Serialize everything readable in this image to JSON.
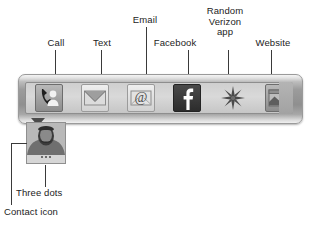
{
  "figure": {
    "line_color": "#3a3a3a",
    "text_color": "#232323"
  },
  "action_bar": {
    "name": "contact-action-bar",
    "icons": [
      {
        "id": "call",
        "label": "Call",
        "icon_name": "phone-person-icon",
        "tile": "tile-mid"
      },
      {
        "id": "text",
        "label": "Text",
        "icon_name": "envelope-icon",
        "tile": "tile-light"
      },
      {
        "id": "email",
        "label": "Email",
        "icon_name": "at-envelope-icon",
        "tile": "tile-light"
      },
      {
        "id": "facebook",
        "label": "Facebook",
        "icon_name": "facebook-f-icon",
        "tile": "tile-dark"
      },
      {
        "id": "verizon",
        "label": "Random\nVerizon\napp",
        "icon_name": "starburst-icon",
        "tile": "tile-none"
      },
      {
        "id": "website",
        "label": "Website",
        "icon_name": "globe-window-icon",
        "tile": "tile-mid"
      }
    ]
  },
  "callouts": {
    "call": "Call",
    "text": "Text",
    "email": "Email",
    "facebook": "Facebook",
    "verizon": "Random\nVerizon\napp",
    "website": "Website",
    "three_dots": "Three dots",
    "contact_icon": "Contact icon"
  },
  "contact_card": {
    "name": "contact-thumbnail",
    "photo_alt": "contact photo",
    "dots_count": 3
  }
}
